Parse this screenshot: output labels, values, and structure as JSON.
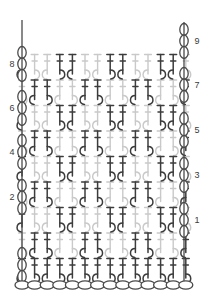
{
  "diagram": {
    "type": "crochet-stitch-diagram",
    "width": 209,
    "height": 302,
    "background": "#ffffff"
  },
  "colors": {
    "dark_stitch": "#3c3c3c",
    "light_stitch": "#c9c9c9",
    "chain_outline": "#4a4a4a",
    "row_number": "#3a3a3a"
  },
  "row_numbers": {
    "right_side_odd": [
      "9",
      "7",
      "5",
      "3",
      "1"
    ],
    "left_side_even": [
      "8",
      "6",
      "4",
      "2"
    ],
    "right_positions_y": [
      41,
      85,
      130,
      175,
      220
    ],
    "left_positions_y": [
      64,
      108,
      152,
      197
    ],
    "left_x": 12,
    "right_x": 197
  },
  "grid": {
    "rows": 9,
    "columns": 14,
    "column_x_start": 22,
    "column_spacing": 12.6,
    "row_y_bottom": 283,
    "row_height": 25.5
  },
  "foundation_chain": {
    "count": 14,
    "y": 285,
    "oval_rx": 7.0,
    "oval_ry": 4.2,
    "x_start": 22,
    "spacing": 12.6,
    "label": "chain-stitch"
  },
  "edge_chains": {
    "left_x": 22,
    "right_x": 184,
    "oval_rx": 4.2,
    "oval_ry": 6.0,
    "per_cluster": 3,
    "label": "turning-chain"
  },
  "legend_symbols": {
    "chain": "oval",
    "double_crochet": "vertical-stem-with-crossbar",
    "front_post_dc": "curved-hook-stem-dark",
    "back_post_dc": "curved-hook-stem-light"
  },
  "stitch_rows": [
    {
      "row": 1,
      "pattern": [
        "d",
        "d",
        "d",
        "d",
        "d",
        "d",
        "d",
        "d",
        "d",
        "d",
        "d",
        "d",
        "d",
        "d"
      ]
    },
    {
      "row": 2,
      "pattern": [
        "l",
        "d",
        "d",
        "l",
        "l",
        "d",
        "d",
        "l",
        "l",
        "d",
        "d",
        "l",
        "l",
        "d"
      ]
    },
    {
      "row": 3,
      "pattern": [
        "d",
        "l",
        "l",
        "d",
        "d",
        "l",
        "l",
        "d",
        "d",
        "l",
        "l",
        "d",
        "d",
        "l"
      ]
    },
    {
      "row": 4,
      "pattern": [
        "l",
        "d",
        "d",
        "l",
        "l",
        "d",
        "d",
        "l",
        "l",
        "d",
        "d",
        "l",
        "l",
        "d"
      ]
    },
    {
      "row": 5,
      "pattern": [
        "d",
        "l",
        "l",
        "d",
        "d",
        "l",
        "l",
        "d",
        "d",
        "l",
        "l",
        "d",
        "d",
        "l"
      ]
    },
    {
      "row": 6,
      "pattern": [
        "l",
        "d",
        "d",
        "l",
        "l",
        "d",
        "d",
        "l",
        "l",
        "d",
        "d",
        "l",
        "l",
        "d"
      ]
    },
    {
      "row": 7,
      "pattern": [
        "d",
        "l",
        "l",
        "d",
        "d",
        "l",
        "l",
        "d",
        "d",
        "l",
        "l",
        "d",
        "d",
        "l"
      ]
    },
    {
      "row": 8,
      "pattern": [
        "l",
        "d",
        "d",
        "l",
        "l",
        "d",
        "d",
        "l",
        "l",
        "d",
        "d",
        "l",
        "l",
        "d"
      ]
    },
    {
      "row": 9,
      "pattern": [
        "d",
        "l",
        "l",
        "d",
        "d",
        "l",
        "l",
        "d",
        "d",
        "l",
        "l",
        "d",
        "d",
        "l"
      ]
    }
  ]
}
